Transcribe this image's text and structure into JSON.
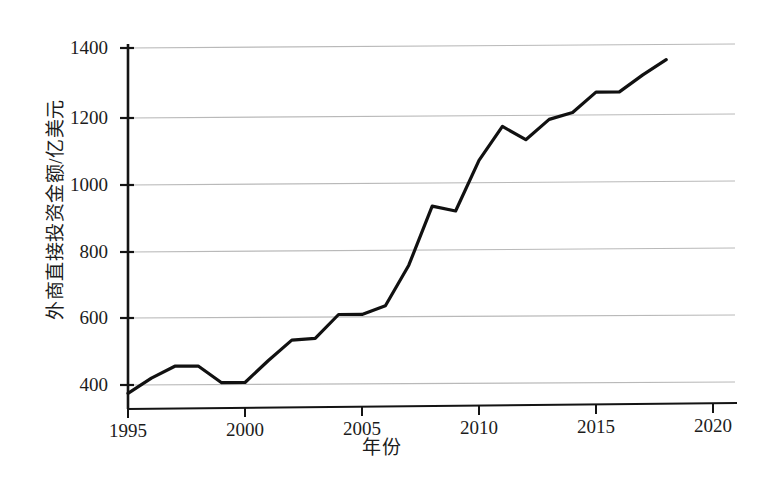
{
  "chart_data": {
    "type": "line",
    "title": "",
    "xlabel": "年份",
    "ylabel": "外商直接投资金额/亿美元",
    "xlim": [
      1994,
      2020
    ],
    "ylim": [
      360,
      1420
    ],
    "xticks": [
      1995,
      2000,
      2005,
      2010,
      2015,
      2020
    ],
    "xtick_labels": [
      "1995",
      "2000",
      "2005",
      "2010",
      "2015",
      "2020"
    ],
    "yticks": [
      400,
      600,
      800,
      1000,
      1200,
      1400
    ],
    "ytick_labels": [
      "400",
      "600",
      "800",
      "1000",
      "1200",
      "1400"
    ],
    "grid": "horizontal",
    "legend": "none",
    "line_color": "#111111",
    "line_width": 3.2,
    "x": [
      1995,
      1996,
      1997,
      1998,
      1999,
      2000,
      2001,
      2002,
      2003,
      2004,
      2005,
      2006,
      2007,
      2008,
      2009,
      2010,
      2011,
      2012,
      2013,
      2014,
      2015,
      2016,
      2017,
      2018
    ],
    "values": [
      375,
      420,
      455,
      455,
      405,
      405,
      470,
      530,
      535,
      605,
      605,
      630,
      750,
      925,
      910,
      1060,
      1160,
      1120,
      1180,
      1200,
      1260,
      1260,
      1310,
      1355
    ],
    "series": [
      {
        "name": "外商直接投资金额",
        "values": [
          375,
          420,
          455,
          455,
          405,
          405,
          470,
          530,
          535,
          605,
          605,
          630,
          750,
          925,
          910,
          1060,
          1160,
          1120,
          1180,
          1200,
          1260,
          1260,
          1310,
          1355
        ]
      }
    ],
    "annotations": []
  },
  "axes": {
    "x_title": "年份",
    "y_title": "外商直接投资金额/亿美元"
  },
  "colors": {
    "line": "#111111",
    "grid": "#b8b8b8",
    "axis": "#1a1a1a",
    "background": "#ffffff"
  }
}
